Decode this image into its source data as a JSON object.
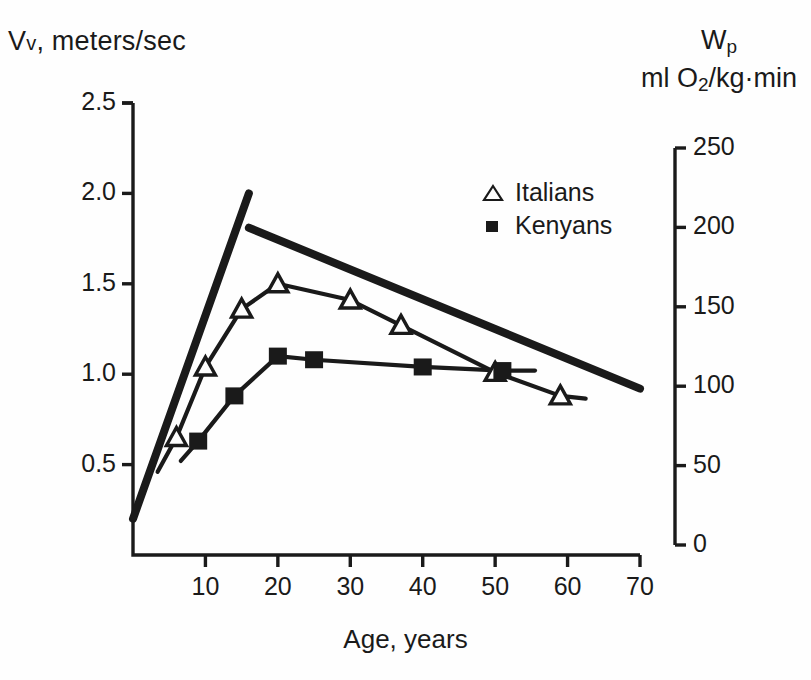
{
  "axes": {
    "left_title_main": "V",
    "left_title_sub": "v",
    "left_title_rest": ", meters/sec",
    "right_title_main": "W",
    "right_title_sub": "p",
    "right_title_units_a": "ml O",
    "right_title_units_sub": "2",
    "right_title_units_b": "/kg·min",
    "x_title": "Age, years"
  },
  "legend": {
    "items": [
      {
        "marker": "open-triangle",
        "label": "Italians"
      },
      {
        "marker": "filled-square",
        "label": "Kenyans"
      }
    ]
  },
  "chart_data": {
    "type": "line",
    "title": "",
    "xlabel": "Age, years",
    "ylabel": "Vv, meters/sec",
    "y2label": "Wp, ml O2/kg·min",
    "xlim": [
      0,
      70
    ],
    "ylim": [
      0,
      2.5
    ],
    "y2lim": [
      0,
      250
    ],
    "grid": false,
    "legend_position": "top-right-inside",
    "xticks": [
      10,
      20,
      30,
      40,
      50,
      60,
      70
    ],
    "xticklabels": [
      "10",
      "20",
      "30",
      "40",
      "50",
      "60",
      "70"
    ],
    "yticks": [
      0.5,
      1.0,
      1.5,
      2.0,
      2.5
    ],
    "yticklabels": [
      "0.5",
      "1.0",
      "1.5",
      "2.0",
      "2.5"
    ],
    "y2ticks": [
      0,
      50,
      100,
      150,
      200,
      250
    ],
    "y2ticklabels": [
      "0",
      "50",
      "100",
      "150",
      "200",
      "250"
    ],
    "series": [
      {
        "name": "Italians",
        "marker": "open-triangle",
        "x": [
          6,
          10,
          15,
          20,
          30,
          37,
          50,
          59
        ],
        "y": [
          0.65,
          1.04,
          1.36,
          1.5,
          1.41,
          1.27,
          1.01,
          0.88
        ]
      },
      {
        "name": "Kenyans",
        "marker": "filled-square",
        "x": [
          9,
          14,
          20,
          25,
          40,
          51
        ],
        "y": [
          0.63,
          0.88,
          1.1,
          1.08,
          1.04,
          1.02
        ]
      },
      {
        "name": "envelope-rising",
        "marker": "none",
        "x": [
          0,
          16
        ],
        "y": [
          0.2,
          2.0
        ]
      },
      {
        "name": "envelope-declining",
        "marker": "none",
        "x": [
          16,
          70
        ],
        "y": [
          1.81,
          0.92
        ]
      }
    ]
  }
}
